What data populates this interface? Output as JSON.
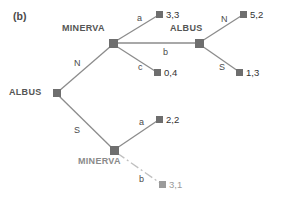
{
  "figure": {
    "panel_tag": "(b)",
    "width": 283,
    "height": 199
  },
  "colors": {
    "node_fill": "#6e6e6e",
    "edge": "#8c8c8c",
    "edge_highlight": "#a8a8a8",
    "text": "#3a3a3a",
    "text_bold": "#333333",
    "text_faded": "#9b9b9b",
    "background": "#ffffff"
  },
  "players": {
    "root": "ALBUS",
    "upper_decision": "MINERVA",
    "upper_second": "ALBUS",
    "lower_decision": "MINERVA"
  },
  "nodes": [
    {
      "id": "root",
      "label": "ALBUS",
      "x": 57,
      "y": 93,
      "kind": "decision"
    },
    {
      "id": "minerva_up",
      "label": "MINERVA",
      "x": 113,
      "y": 43,
      "kind": "decision"
    },
    {
      "id": "albus_2",
      "label": "ALBUS",
      "x": 199,
      "y": 43,
      "kind": "decision"
    },
    {
      "id": "minerva_dn",
      "label": "MINERVA",
      "x": 114,
      "y": 150,
      "kind": "decision"
    },
    {
      "id": "t_33",
      "label": "3,3",
      "x": 160,
      "y": 14,
      "kind": "terminal"
    },
    {
      "id": "t_04",
      "label": "0,4",
      "x": 158,
      "y": 72,
      "kind": "terminal"
    },
    {
      "id": "t_52",
      "label": "5,2",
      "x": 244,
      "y": 14,
      "kind": "terminal"
    },
    {
      "id": "t_13",
      "label": "1,3",
      "x": 240,
      "y": 72,
      "kind": "terminal"
    },
    {
      "id": "t_22",
      "label": "2,2",
      "x": 160,
      "y": 119,
      "kind": "terminal"
    },
    {
      "id": "t_31",
      "label": "3,1",
      "x": 163,
      "y": 184,
      "kind": "terminal"
    }
  ],
  "edges": [
    {
      "from": "root",
      "to": "minerva_up",
      "action": "N",
      "label_x": 74,
      "label_y": 59,
      "style": "normal"
    },
    {
      "from": "root",
      "to": "minerva_dn",
      "action": "S",
      "label_x": 74,
      "label_y": 126,
      "style": "normal"
    },
    {
      "from": "minerva_up",
      "to": "t_33",
      "action": "a",
      "label_x": 137,
      "label_y": 14,
      "style": "normal"
    },
    {
      "from": "minerva_up",
      "to": "albus_2",
      "action": "b",
      "label_x": 163,
      "label_y": 48,
      "style": "highlight"
    },
    {
      "from": "minerva_up",
      "to": "t_04",
      "action": "c",
      "label_x": 138,
      "label_y": 63,
      "style": "normal"
    },
    {
      "from": "albus_2",
      "to": "t_52",
      "action": "N",
      "label_x": 221,
      "label_y": 15,
      "style": "normal"
    },
    {
      "from": "albus_2",
      "to": "t_13",
      "action": "S",
      "label_x": 219,
      "label_y": 63,
      "style": "normal"
    },
    {
      "from": "minerva_dn",
      "to": "t_22",
      "action": "a",
      "label_x": 139,
      "label_y": 118,
      "style": "normal"
    },
    {
      "from": "minerva_dn",
      "to": "t_31",
      "action": "b",
      "label_x": 139,
      "label_y": 175,
      "style": "faded"
    }
  ],
  "payoffs": [
    {
      "id": "t_33",
      "first": "3",
      "second": "3",
      "text": "3,3",
      "faded": false
    },
    {
      "id": "t_04",
      "first": "0",
      "second": "4",
      "text": "0,4",
      "faded": false
    },
    {
      "id": "t_52",
      "first": "5",
      "second": "2",
      "text": "5,2",
      "faded": false
    },
    {
      "id": "t_13",
      "first": "1",
      "second": "3",
      "text": "1,3",
      "faded": false
    },
    {
      "id": "t_22",
      "first": "2",
      "second": "2",
      "text": "2,2",
      "faded": false
    },
    {
      "id": "t_31",
      "first": "3",
      "second": "1",
      "text": "3,1",
      "faded": true
    }
  ],
  "labels": {
    "panel": "(b)",
    "root_player": "ALBUS",
    "minerva_top": "MINERVA",
    "albus_mid": "ALBUS",
    "minerva_bottom": "MINERVA",
    "action_N_root": "N",
    "action_S_root": "S",
    "action_a_top": "a",
    "action_b_top": "b",
    "action_c_top": "c",
    "action_N_albus": "N",
    "action_S_albus": "S",
    "action_a_bottom": "a",
    "action_b_bottom": "b",
    "payoff_33": "3,3",
    "payoff_04": "0,4",
    "payoff_52": "5,2",
    "payoff_13": "1,3",
    "payoff_22": "2,2",
    "payoff_31": "3,1"
  }
}
